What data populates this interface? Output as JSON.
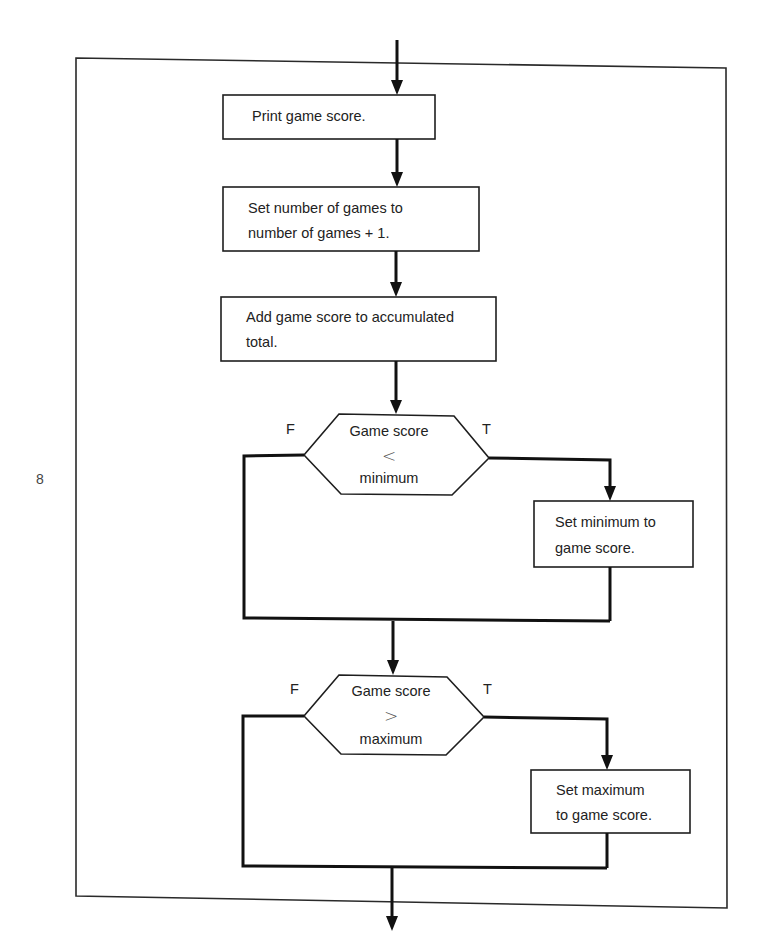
{
  "page_number": "8",
  "steps": {
    "print": {
      "line1": "Print game score."
    },
    "increment": {
      "line1": "Set number of games to",
      "line2": "number of games + 1."
    },
    "accumulate": {
      "line1": "Add game score to accumulated",
      "line2": "total."
    }
  },
  "decision_min": {
    "line1": "Game score",
    "operator": "<",
    "line3": "minimum",
    "false_label": "F",
    "true_label": "T",
    "true_action": {
      "line1": "Set minimum to",
      "line2": "game score."
    }
  },
  "decision_max": {
    "line1": "Game score",
    "operator": ">",
    "line3": "maximum",
    "false_label": "F",
    "true_label": "T",
    "true_action": {
      "line1": "Set maximum",
      "line2": "to game score."
    }
  },
  "colors": {
    "ink": "#111111",
    "paper": "#ffffff"
  }
}
